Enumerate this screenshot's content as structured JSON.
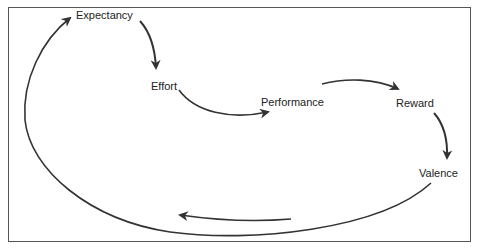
{
  "diagram": {
    "type": "cycle",
    "title": "",
    "stroke_color": "#333333",
    "frame_color": "#555555",
    "nodes": [
      {
        "id": "expectancy",
        "label": "Expectancy"
      },
      {
        "id": "effort",
        "label": "Effort"
      },
      {
        "id": "performance",
        "label": "Performance"
      },
      {
        "id": "reward",
        "label": "Reward"
      },
      {
        "id": "valence",
        "label": "Valence"
      }
    ],
    "edges": [
      {
        "from": "expectancy",
        "to": "effort"
      },
      {
        "from": "effort",
        "to": "performance"
      },
      {
        "from": "performance",
        "to": "reward"
      },
      {
        "from": "reward",
        "to": "valence"
      },
      {
        "from": "valence",
        "to": "expectancy"
      }
    ]
  }
}
